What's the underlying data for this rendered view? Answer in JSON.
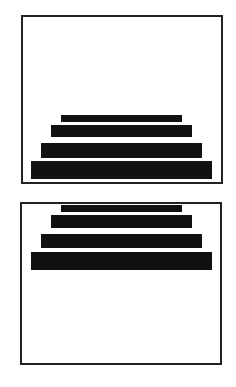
{
  "diagram": {
    "panels": [
      {
        "id": "panel-bottom-aligned",
        "alignment": "bottom",
        "bars": [
          {
            "label": "tier-1",
            "relative_width": 0.67
          },
          {
            "label": "tier-2",
            "relative_width": 0.78
          },
          {
            "label": "tier-3",
            "relative_width": 0.89
          },
          {
            "label": "tier-4",
            "relative_width": 1.0
          }
        ]
      },
      {
        "id": "panel-top-aligned",
        "alignment": "top",
        "bars": [
          {
            "label": "tier-1",
            "relative_width": 0.67
          },
          {
            "label": "tier-2",
            "relative_width": 0.78
          },
          {
            "label": "tier-3",
            "relative_width": 0.89
          },
          {
            "label": "tier-4",
            "relative_width": 1.0
          }
        ]
      }
    ],
    "colors": {
      "bar": "#111111",
      "border": "#222222",
      "background": "#ffffff"
    }
  }
}
